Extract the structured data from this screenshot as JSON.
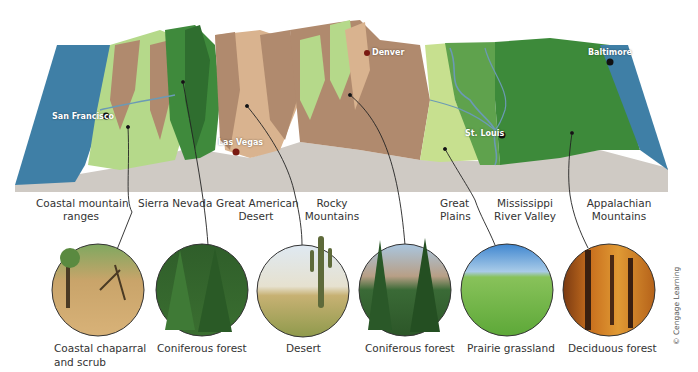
{
  "figure": {
    "type": "3D relief cross-section of the continental United States with biome photo callouts",
    "cities": [
      {
        "name": "San Francisco",
        "x": 52,
        "y": 112
      },
      {
        "name": "Las Vegas",
        "x": 218,
        "y": 138
      },
      {
        "name": "Denver",
        "x": 372,
        "y": 50
      },
      {
        "name": "St. Louis",
        "x": 465,
        "y": 129
      },
      {
        "name": "Baltimore",
        "x": 588,
        "y": 50
      }
    ],
    "regions": [
      {
        "line1": "Coastal mountain",
        "line2": "ranges"
      },
      {
        "line1": "Sierra Nevada",
        "line2": ""
      },
      {
        "line1": "Great American",
        "line2": "Desert"
      },
      {
        "line1": "Rocky",
        "line2": "Mountains"
      },
      {
        "line1": "Great",
        "line2": "Plains"
      },
      {
        "line1": "Mississippi",
        "line2": "River Valley"
      },
      {
        "line1": "Appalachian",
        "line2": "Mountains"
      }
    ],
    "biomes": [
      {
        "line1": "Coastal chaparral",
        "line2": "and scrub"
      },
      {
        "line1": "Coniferous forest",
        "line2": ""
      },
      {
        "line1": "Desert",
        "line2": ""
      },
      {
        "line1": "Coniferous forest",
        "line2": ""
      },
      {
        "line1": "Prairie grassland",
        "line2": ""
      },
      {
        "line1": "Deciduous forest",
        "line2": ""
      }
    ],
    "credit": "© Cengage Learning"
  },
  "colors": {
    "ocean": "#3f7fa6",
    "coastal_green": "#b5d98a",
    "conifer_dark": "#3f8a3c",
    "desert_tan": "#d9b38f",
    "mountain_brown": "#b08a6e",
    "plains_light": "#c7e08f",
    "valley_green": "#5fa24d",
    "deciduous_green": "#3d8a3a",
    "base_gray": "#cfcac4",
    "river": "#6b9ab5"
  }
}
